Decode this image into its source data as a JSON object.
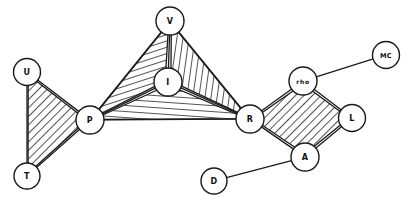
{
  "diagram": {
    "type": "node-link-diagram",
    "background_color": "#ffffff",
    "line_color": "#1a1a1a",
    "node_fill_color": "#ffffff",
    "canvas": {
      "width": 411,
      "height": 202
    },
    "nodes": [
      {
        "id": "U",
        "label": "U",
        "cx": 27,
        "cy": 72,
        "r": 13.5,
        "label_size": "single"
      },
      {
        "id": "T",
        "label": "T",
        "cx": 27,
        "cy": 176,
        "r": 13.0,
        "label_size": "single"
      },
      {
        "id": "P",
        "label": "P",
        "cx": 90,
        "cy": 120,
        "r": 14.0,
        "label_size": "single"
      },
      {
        "id": "V",
        "label": "V",
        "cx": 170,
        "cy": 21,
        "r": 14.0,
        "label_size": "single"
      },
      {
        "id": "I",
        "label": "I",
        "cx": 168,
        "cy": 82,
        "r": 14.0,
        "label_size": "single"
      },
      {
        "id": "R",
        "label": "R",
        "cx": 250,
        "cy": 119,
        "r": 14.0,
        "label_size": "single"
      },
      {
        "id": "rho",
        "label": "rho",
        "cx": 303,
        "cy": 81,
        "r": 14.0,
        "label_size": "triple"
      },
      {
        "id": "MC",
        "label": "MC",
        "cx": 386,
        "cy": 55,
        "r": 13.5,
        "label_size": "double"
      },
      {
        "id": "L",
        "label": "L",
        "cx": 352,
        "cy": 118,
        "r": 13.5,
        "label_size": "single"
      },
      {
        "id": "A",
        "label": "A",
        "cx": 305,
        "cy": 157,
        "r": 14.0,
        "label_size": "single"
      },
      {
        "id": "D",
        "label": "D",
        "cx": 214,
        "cy": 181,
        "r": 13.0,
        "label_size": "single"
      }
    ],
    "edges": [
      {
        "from": "U",
        "to": "T",
        "style": "plain"
      },
      {
        "from": "U",
        "to": "P",
        "style": "plain"
      },
      {
        "from": "T",
        "to": "P",
        "style": "plain"
      },
      {
        "from": "P",
        "to": "V",
        "style": "plain"
      },
      {
        "from": "P",
        "to": "I",
        "style": "plain"
      },
      {
        "from": "P",
        "to": "R",
        "style": "plain"
      },
      {
        "from": "V",
        "to": "I",
        "style": "plain"
      },
      {
        "from": "V",
        "to": "R",
        "style": "plain"
      },
      {
        "from": "I",
        "to": "R",
        "style": "plain"
      },
      {
        "from": "R",
        "to": "rho",
        "style": "plain"
      },
      {
        "from": "R",
        "to": "A",
        "style": "plain"
      },
      {
        "from": "rho",
        "to": "L",
        "style": "plain"
      },
      {
        "from": "rho",
        "to": "MC",
        "style": "plain"
      },
      {
        "from": "L",
        "to": "A",
        "style": "plain"
      },
      {
        "from": "A",
        "to": "D",
        "style": "plain"
      }
    ],
    "hatched_regions": [
      {
        "id": "region-u-t-p",
        "nodes": [
          "U",
          "T",
          "P"
        ],
        "hatch": "hatch-a",
        "label": "Triangle U-T-P"
      },
      {
        "id": "region-p-v-i",
        "nodes": [
          "P",
          "V",
          "I"
        ],
        "hatch": "hatch-b",
        "label": "Triangle P-V-I"
      },
      {
        "id": "region-v-r-i",
        "nodes": [
          "V",
          "R",
          "I"
        ],
        "hatch": "hatch-c",
        "label": "Triangle V-R-I"
      },
      {
        "id": "region-p-i-r",
        "nodes": [
          "P",
          "I",
          "R"
        ],
        "hatch": "hatch-d",
        "label": "Triangle P-I-R"
      },
      {
        "id": "region-r-rho-l-a",
        "nodes": [
          "R",
          "rho",
          "L",
          "A"
        ],
        "hatch": "hatch-a",
        "label": "Diamond R-rho-L-A"
      }
    ]
  }
}
